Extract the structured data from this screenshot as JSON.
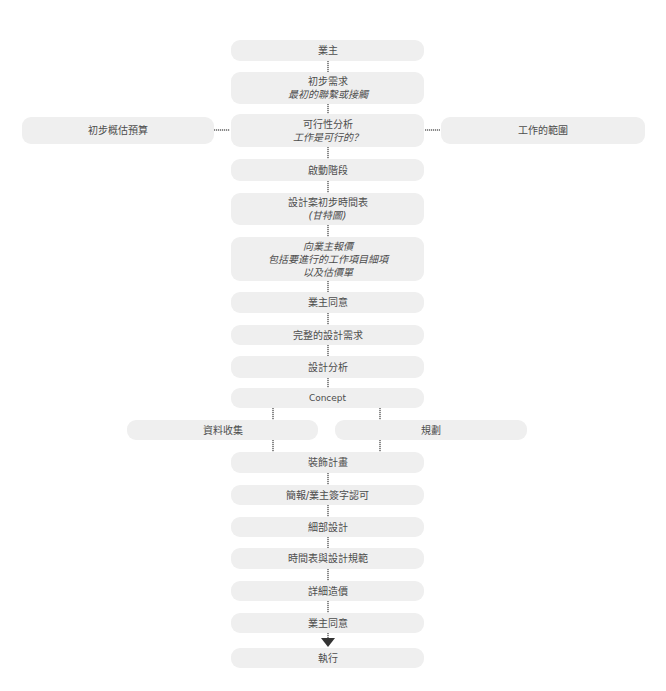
{
  "flowchart": {
    "nodes": {
      "owner": {
        "line1": "業主"
      },
      "initial_requirement": {
        "line1": "初步需求",
        "line2": "最初的聯繫或接觸"
      },
      "feasibility": {
        "line1": "可行性分析",
        "line2": "工作是可行的？"
      },
      "initial_budget": {
        "line1": "初步概估預算"
      },
      "scope_of_work": {
        "line1": "工作的範圍"
      },
      "kickoff": {
        "line1": "啟動階段"
      },
      "schedule": {
        "line1": "設計案初步時間表",
        "line2": "(甘特圖)"
      },
      "quotation": {
        "line1": "向業主報價",
        "line2": "包括要進行的工作項目細項",
        "line3": "以及估價單"
      },
      "owner_agree_1": {
        "line1": "業主同意"
      },
      "full_requirements": {
        "line1": "完整的設計需求"
      },
      "design_analysis": {
        "line1": "設計分析"
      },
      "concept": {
        "line1": "Concept"
      },
      "data_collection": {
        "line1": "資料收集"
      },
      "planning": {
        "line1": "規劃"
      },
      "decoration_plan": {
        "line1": "裝飾計畫"
      },
      "presentation": {
        "line1": "簡報/業主簽字認可"
      },
      "detailed_design": {
        "line1": "細部設計"
      },
      "schedule_spec": {
        "line1": "時間表與設計規範"
      },
      "detailed_cost": {
        "line1": "詳細造價"
      },
      "owner_agree_2": {
        "line1": "業主同意"
      },
      "execution": {
        "line1": "執行"
      }
    },
    "colors": {
      "box_fill": "#efefef",
      "text": "#4d4d4d",
      "connector": "#8a8a8a",
      "arrow": "#333333"
    }
  }
}
